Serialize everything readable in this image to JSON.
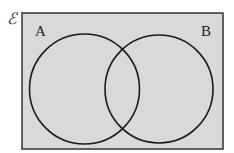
{
  "diagram": {
    "type": "venn",
    "universal_set_symbol": "ℰ",
    "sets": [
      {
        "label": "A"
      },
      {
        "label": "B"
      }
    ],
    "colors": {
      "background": "#d9d9d9",
      "stroke": "#1a1a1a",
      "page": "#ffffff"
    }
  }
}
